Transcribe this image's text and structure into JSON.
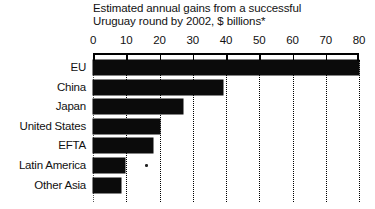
{
  "chart_data": {
    "type": "bar",
    "orientation": "horizontal",
    "title": "Estimated annual gains from a successful\nUruguay round by 2002, $ billions*",
    "title_line1": "Estimated annual gains from a successful",
    "title_line2": "Uruguay round by 2002, $ billions*",
    "xlabel": "",
    "ylabel": "",
    "xlim": [
      0,
      80
    ],
    "grid": true,
    "grid_axis": "x",
    "legend": "none",
    "axis_position": "top",
    "categories": [
      "EU",
      "China",
      "Japan",
      "United States",
      "EFTA",
      "Latin America",
      "Other Asia"
    ],
    "values": [
      80,
      39,
      27,
      20,
      18,
      9.5,
      8.5
    ],
    "tick_labels": [
      "0",
      "10",
      "20",
      "30",
      "40",
      "50",
      "60",
      "70",
      "80"
    ],
    "tick_values": [
      0,
      10,
      20,
      30,
      40,
      50,
      60,
      70,
      80
    ],
    "bar_color": "#0b0b0b",
    "background_color": "#ffffff",
    "footnote_marker": "*"
  }
}
